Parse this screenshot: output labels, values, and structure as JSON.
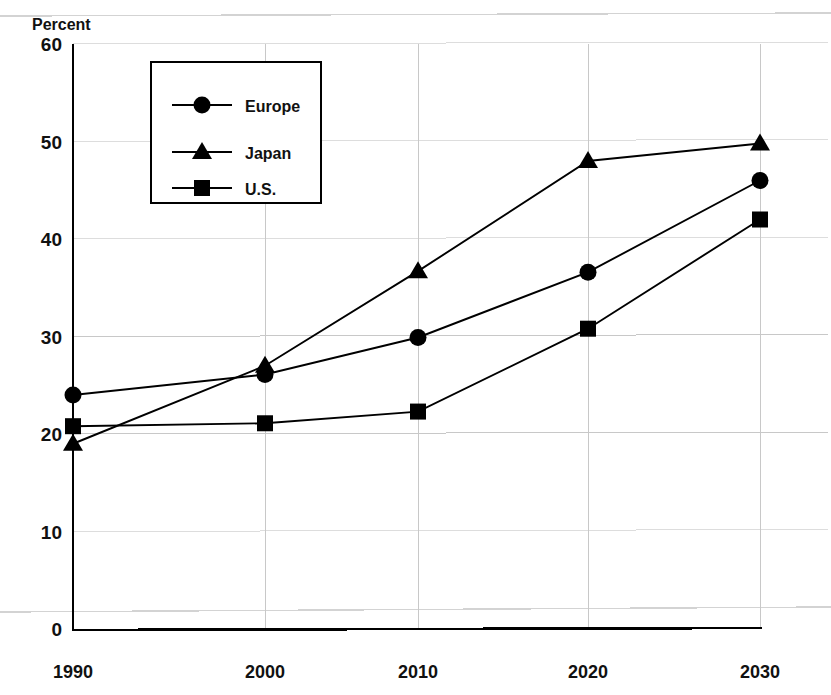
{
  "chart_data": {
    "type": "line",
    "title": "",
    "subtitle": "",
    "xlabel": "",
    "ylabel": "Percent",
    "categories": [
      "1990",
      "2000",
      "2010",
      "2020",
      "2030"
    ],
    "x": [
      1990,
      2000,
      2010,
      2020,
      2030
    ],
    "xlim": [
      1990,
      2030
    ],
    "ylim": [
      0,
      60
    ],
    "yticks": [
      0,
      10,
      20,
      30,
      40,
      50,
      60
    ],
    "ytick_labels": [
      "0",
      "10",
      "20",
      "30",
      "40",
      "50",
      "60"
    ],
    "xtick_labels": [
      "1990",
      "2000",
      "2010",
      "2020",
      "2030"
    ],
    "grid": true,
    "legend_position": "upper-left-inside",
    "series": [
      {
        "name": "Europe",
        "marker": "circle",
        "color": "#000000",
        "values": [
          24.0,
          26.1,
          29.9,
          36.6,
          46.0
        ]
      },
      {
        "name": "Japan",
        "marker": "triangle",
        "color": "#000000",
        "values": [
          19.0,
          27.0,
          36.7,
          48.0,
          49.8
        ]
      },
      {
        "name": "U.S.",
        "marker": "square",
        "color": "#000000",
        "values": [
          20.8,
          21.1,
          22.3,
          30.8,
          42.0
        ]
      }
    ]
  },
  "axes": {
    "y_axis_title": "Percent"
  },
  "legend": {
    "entries": [
      {
        "label": "Europe",
        "marker": "circle"
      },
      {
        "label": "Japan",
        "marker": "triangle"
      },
      {
        "label": "U.S.",
        "marker": "square"
      }
    ]
  },
  "colors": {
    "ink": "#000000",
    "gridline": "#c8c8c8",
    "page_rule": "#d3d3d3",
    "background": "#ffffff"
  }
}
